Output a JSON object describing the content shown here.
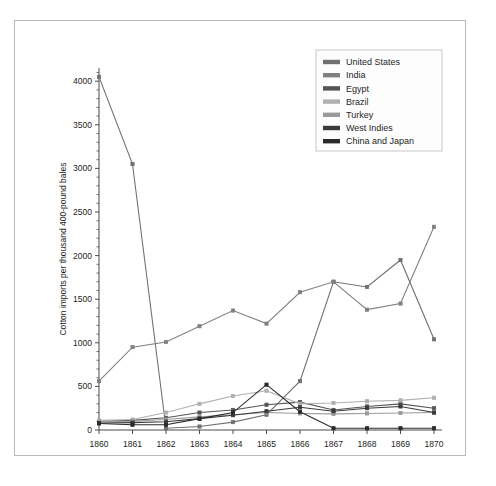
{
  "figure": {
    "background": "#ffffff",
    "frame_border_color": "#b9b9b9"
  },
  "chart_data": {
    "type": "line",
    "title": "",
    "xlabel": "",
    "ylabel": "Cotton imports per thousand 400-pound bales",
    "x": [
      1860,
      1861,
      1862,
      1863,
      1864,
      1865,
      1866,
      1867,
      1868,
      1869,
      1870
    ],
    "xtick_labels": [
      "1860",
      "1861",
      "1862",
      "1863",
      "1864",
      "1865",
      "1866",
      "1867",
      "1868",
      "1869",
      "1870"
    ],
    "ytick_labels": [
      "0",
      "500",
      "1000",
      "1500",
      "2000",
      "2500",
      "3000",
      "3500",
      "4000"
    ],
    "yticks": [
      0,
      500,
      1000,
      1500,
      2000,
      2500,
      3000,
      3500,
      4000
    ],
    "xlim": [
      1860,
      1870
    ],
    "ylim": [
      0,
      4200
    ],
    "grid": false,
    "legend_position": "top-right",
    "marker": "square",
    "series": [
      {
        "name": "United States",
        "color": "#707070",
        "values": [
          4050,
          3050,
          20,
          40,
          90,
          175,
          560,
          1700,
          1640,
          1950,
          1040
        ]
      },
      {
        "name": "India",
        "color": "#808080",
        "values": [
          560,
          950,
          1010,
          1190,
          1370,
          1220,
          1580,
          1700,
          1380,
          1450,
          2330
        ]
      },
      {
        "name": "Egypt",
        "color": "#555555",
        "values": [
          100,
          110,
          140,
          200,
          230,
          290,
          320,
          230,
          270,
          300,
          250
        ]
      },
      {
        "name": "Brazil",
        "color": "#b0b0b0",
        "values": [
          110,
          120,
          200,
          300,
          390,
          450,
          300,
          310,
          330,
          340,
          370
        ]
      },
      {
        "name": "Turkey",
        "color": "#9a9a9a",
        "values": [
          95,
          100,
          120,
          150,
          175,
          200,
          190,
          185,
          190,
          195,
          200
        ]
      },
      {
        "name": "West Indies",
        "color": "#3a3a3a",
        "values": [
          80,
          85,
          95,
          130,
          170,
          215,
          260,
          215,
          250,
          270,
          200
        ]
      },
      {
        "name": "China and Japan",
        "color": "#2a2a2a",
        "values": [
          75,
          60,
          60,
          130,
          200,
          520,
          210,
          20,
          20,
          20,
          20
        ]
      }
    ]
  },
  "legend": {
    "entries": [
      {
        "label": "United States",
        "color": "#707070"
      },
      {
        "label": "India",
        "color": "#808080"
      },
      {
        "label": "Egypt",
        "color": "#555555"
      },
      {
        "label": "Brazil",
        "color": "#b0b0b0"
      },
      {
        "label": "Turkey",
        "color": "#9a9a9a"
      },
      {
        "label": "West Indies",
        "color": "#3a3a3a"
      },
      {
        "label": "China and Japan",
        "color": "#2a2a2a"
      }
    ]
  }
}
